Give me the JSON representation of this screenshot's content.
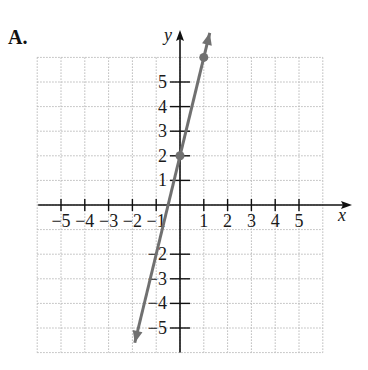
{
  "figure": {
    "label": "A."
  },
  "chart_data": {
    "type": "line",
    "title": "",
    "xlabel": "x",
    "ylabel": "y",
    "xlim": [
      -6,
      6
    ],
    "ylim": [
      -6,
      6
    ],
    "grid": true,
    "x_ticks": [
      -5,
      -4,
      -3,
      -2,
      -1,
      1,
      2,
      3,
      4,
      5
    ],
    "y_ticks": [
      -5,
      -4,
      -3,
      -2,
      1,
      2,
      3,
      4,
      5
    ],
    "x_tick_labels": [
      "−5",
      "−4",
      "−3",
      "−2",
      "−1",
      "1",
      "2",
      "3",
      "4",
      "5"
    ],
    "y_tick_labels_positive": [
      "1",
      "2",
      "3",
      "4",
      "5"
    ],
    "y_tick_labels_negative": [
      "−2",
      "−3",
      "−4",
      "−5"
    ],
    "series": [
      {
        "name": "y = 4x + 2",
        "equation": "y = 4x + 2",
        "slope": 4,
        "intercept": 2,
        "points": [
          {
            "x": 0,
            "y": 2
          },
          {
            "x": 1,
            "y": 6
          }
        ],
        "line_extent": {
          "x_start": -1.9,
          "x_end": 1.25
        },
        "color": "#707070"
      }
    ]
  },
  "colors": {
    "axis": "#111111",
    "grid": "#b8b8b8",
    "line": "#707070"
  }
}
